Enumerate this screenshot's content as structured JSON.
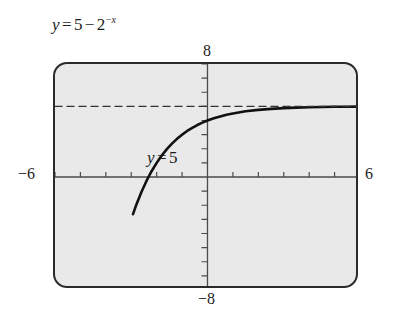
{
  "figure": {
    "caption": {
      "lhs": "y",
      "equals": "=",
      "constant": "5",
      "minus": "−",
      "base": "2",
      "exponent_sign": "−",
      "exponent_var": "x",
      "full_text": "y = 5 − 2^(−x)"
    },
    "screen": {
      "background_color": "#e9e9e9",
      "border_color": "#2a2a2a",
      "curve_color": "#111111",
      "axis_color": "#4a4a4a"
    },
    "axis_extent_labels": {
      "top": "8",
      "bottom": "−8",
      "left": "−6",
      "right": "6"
    },
    "asymptote_label": {
      "lhs": "y",
      "equals": "=",
      "value": "5",
      "full_text": "y = 5"
    }
  },
  "chart_data": {
    "type": "line",
    "xlabel": "",
    "ylabel": "",
    "xlim": [
      -6,
      6
    ],
    "ylim": [
      -8,
      8
    ],
    "grid": false,
    "legend": "none",
    "x_tick_step": 1,
    "y_tick_step": 1,
    "x_tick_labels": [
      "−6",
      "6"
    ],
    "y_tick_labels": [
      "−8",
      "8"
    ],
    "annotations": [
      {
        "text": "y = 5",
        "type": "horizontal-asymptote-label",
        "x": -3.2,
        "y": 6.0
      }
    ],
    "series": [
      {
        "name": "y = 5 − 2^(−x)",
        "style": "solid",
        "color": "#111111",
        "x": [
          -2.93,
          -2.8,
          -2.6,
          -2.4,
          -2.3219,
          -2.2,
          -2.0,
          -1.8,
          -1.6,
          -1.4,
          -1.2,
          -1.0,
          -0.8,
          -0.6,
          -0.4,
          -0.2,
          0.0,
          0.25,
          0.5,
          0.75,
          1.0,
          1.5,
          2.0,
          2.5,
          3.0,
          3.5,
          4.0,
          4.5,
          5.0,
          5.5,
          6.0
        ],
        "y": [
          -2.63,
          -1.96,
          -1.06,
          -0.28,
          0.0,
          0.41,
          1.0,
          1.52,
          1.97,
          2.36,
          2.7,
          3.0,
          3.26,
          3.48,
          3.68,
          3.85,
          4.0,
          4.16,
          4.29,
          4.41,
          4.5,
          4.65,
          4.75,
          4.82,
          4.875,
          4.91,
          4.9375,
          4.956,
          4.969,
          4.978,
          4.984
        ]
      },
      {
        "name": "y = 5",
        "style": "dashed",
        "color": "#333333",
        "x": [
          -6,
          6
        ],
        "y": [
          5,
          5
        ]
      }
    ]
  }
}
